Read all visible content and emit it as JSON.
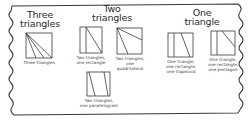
{
  "headings": [
    {
      "line1": "Three",
      "line2": "triangles"
    },
    {
      "line1": "Two",
      "line2": "triangles"
    },
    {
      "line1": "One",
      "line2": "triangle"
    }
  ],
  "figures": [
    {
      "caption_line1": "Three triangles",
      "caption_line2": ""
    },
    {
      "caption_line1": "Two triangles,",
      "caption_line2": "one rectangle"
    },
    {
      "caption_line1": "Two triangles,",
      "caption_line2": "one",
      "caption_line3": "quadrilateral"
    },
    {
      "caption_line1": "Two triangles,",
      "caption_line2": "one parallelogram"
    },
    {
      "caption_line1": "One triangle,",
      "caption_line2": "one rectangle,",
      "caption_line3": "one trapezoid"
    },
    {
      "caption_line1": "One triangle,",
      "caption_line2": "one rectangle,",
      "caption_line3": "one pentagon"
    }
  ],
  "colors": {
    "stroke": "#3a3a3a",
    "background": "#ffffff"
  }
}
